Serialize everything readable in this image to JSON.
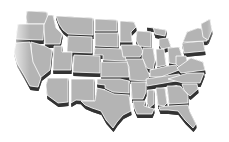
{
  "map": {
    "title": "",
    "colors": {
      "background": "#ffffff",
      "top": "#b4b4b4",
      "top_light": "#c2c2c2",
      "side": "#474747",
      "side_dark": "#333333",
      "gap": "#ffffff"
    },
    "extrude": 4,
    "states": [
      {
        "id": "WA",
        "pts": "27,11 47,12 48,24 27,24 26,17"
      },
      {
        "id": "OR",
        "pts": "18,24 44,24 43,40 16,39 17,30"
      },
      {
        "id": "ID",
        "pts": "48,15 53,15 56,28 62,34 60,44 45,44 44,25"
      },
      {
        "id": "MT",
        "pts": "56,16 93,18 93,35 68,34 63,30 59,24"
      },
      {
        "id": "WY",
        "pts": "68,36 92,37 92,53 67,52"
      },
      {
        "id": "ND",
        "pts": "95,19 117,20 117,31 95,31"
      },
      {
        "id": "SD",
        "pts": "95,33 118,33 118,47 95,46"
      },
      {
        "id": "NE",
        "pts": "95,48 124,49 126,61 103,60 103,55 94,55"
      },
      {
        "id": "MN",
        "pts": "120,21 134,22 136,27 131,32 132,42 120,42"
      },
      {
        "id": "IA",
        "pts": "121,45 140,45 143,52 140,57 123,57"
      },
      {
        "id": "WI",
        "pts": "137,31 151,32 151,47 139,46 136,40"
      },
      {
        "id": "MI",
        "pts": "147,27 166,30 165,36 155,34 153,27 M159,39 168,38 171,47 162,49 159,45"
      },
      {
        "id": "IL",
        "pts": "143,48 153,48 155,60 153,70 147,68 142,58"
      },
      {
        "id": "IN",
        "pts": "156,49 164,49 166,65 157,67"
      },
      {
        "id": "OH",
        "pts": "168,48 179,47 182,56 176,64 169,63"
      },
      {
        "id": "PA",
        "pts": "182,43 203,41 205,51 184,53"
      },
      {
        "id": "NY",
        "pts": "187,32 198,28 206,30 207,41 183,42"
      },
      {
        "id": "NE_states",
        "pts": "201,24 210,19 212,30 208,40 203,37"
      },
      {
        "id": "NV",
        "pts": "31,42 45,46 52,50 50,70 40,78 32,62"
      },
      {
        "id": "CA",
        "pts": "16,43 30,42 33,62 41,78 38,87 30,86 24,75 17,63 14,52"
      },
      {
        "id": "UT",
        "pts": "54,46 62,46 62,52 72,52 71,70 53,70"
      },
      {
        "id": "CO",
        "pts": "74,55 100,56 100,73 73,72"
      },
      {
        "id": "KS",
        "pts": "101,62 128,62 129,77 101,77"
      },
      {
        "id": "MO",
        "pts": "126,59 143,59 146,68 150,76 146,81 130,80 129,67"
      },
      {
        "id": "KY",
        "pts": "150,70 168,66 176,65 179,70 161,77 150,77"
      },
      {
        "id": "WV",
        "pts": "176,56 186,56 188,65 181,69 176,64"
      },
      {
        "id": "VA",
        "pts": "177,68 191,58 203,62 205,70 181,73"
      },
      {
        "id": "TN",
        "pts": "146,79 179,74 182,80 147,86"
      },
      {
        "id": "NC",
        "pts": "168,79 188,73 204,73 200,83 183,83"
      },
      {
        "id": "AZ",
        "pts": "48,78 68,78 68,102 58,103 47,95 46,85"
      },
      {
        "id": "NM",
        "pts": "71,79 94,79 94,101 76,100 71,103"
      },
      {
        "id": "OK",
        "pts": "97,79 120,79 129,81 129,93 113,92 105,88 105,85 97,84"
      },
      {
        "id": "TX",
        "pts": "97,88 105,90 114,94 129,95 131,111 123,115 117,122 113,128 106,120 101,111 92,108 85,105 81,101 95,101"
      },
      {
        "id": "AR",
        "pts": "131,82 146,82 146,92 143,99 132,99"
      },
      {
        "id": "LA",
        "pts": "133,101 145,101 144,106 154,109 152,114 137,114 134,107"
      },
      {
        "id": "MS",
        "pts": "148,90 154,90 154,104 149,108 147,102"
      },
      {
        "id": "AL",
        "pts": "156,88 165,88 167,103 164,106 158,105"
      },
      {
        "id": "GA",
        "pts": "167,86 180,86 188,95 188,103 169,104"
      },
      {
        "id": "SC",
        "pts": "182,84 197,84 198,89 190,96 184,90"
      },
      {
        "id": "FL",
        "pts": "159,107 169,106 188,105 190,112 196,124 193,128 185,120 178,111 168,110 160,110"
      }
    ]
  }
}
